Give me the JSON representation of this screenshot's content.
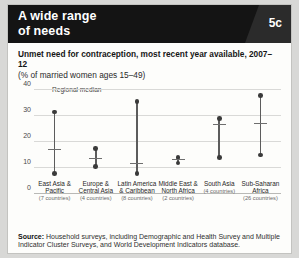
{
  "header": {
    "title_line1": "A wide range",
    "title_line2": "of needs",
    "badge": "5c"
  },
  "chart_title": "Unmet need for contraception, most recent year available, 2007–12",
  "chart_subtitle": "(% of married women ages 15–49)",
  "source": {
    "label": "Source:",
    "text": " Household surveys, including Demographic and Health Survey and Multiple Indicator Cluster Surveys, and World Development Indicators database."
  },
  "chart_data": {
    "type": "scatter",
    "title": "Unmet need for contraception, most recent year available, 2007–12",
    "subtitle": "(% of married women ages 15–49)",
    "xlabel": "",
    "ylabel": "",
    "ylim": [
      0,
      40
    ],
    "yticks": [
      0,
      10,
      20,
      30,
      40
    ],
    "grid": true,
    "legend": [
      {
        "name": "Regional median",
        "marker": "horizontal-line",
        "color": "#6e6e6e"
      }
    ],
    "legend_position": "top-left",
    "marker_color": "#3a3a3a",
    "line_color": "#5c5c5c",
    "categories": [
      "East Asia & Pacific",
      "Europe & Central Asia",
      "Latin America & Caribbean",
      "Middle East & North Africa",
      "South Asia",
      "Sub-Saharan Africa"
    ],
    "category_sublabels": [
      "(7 countries)",
      "(4 countries)",
      "(8 countries)",
      "(2 countries)",
      "(4 countries)",
      "(26 countries)"
    ],
    "series": [
      {
        "name": "Maximum",
        "values": [
          31.5,
          17.5,
          35.5,
          14.0,
          29.0,
          38.0
        ]
      },
      {
        "name": "Minimum",
        "values": [
          8.0,
          10.5,
          8.0,
          12.0,
          14.0,
          15.0
        ]
      },
      {
        "name": "Regional median",
        "values": [
          17.0,
          13.5,
          11.5,
          13.0,
          26.5,
          27.0
        ]
      }
    ],
    "points": [
      {
        "category": "East Asia & Pacific",
        "sublabel": "(7 countries)",
        "min": 8.0,
        "median": 17.0,
        "max": 31.5
      },
      {
        "category": "Europe & Central Asia",
        "sublabel": "(4 countries)",
        "min": 10.5,
        "median": 13.5,
        "max": 17.5
      },
      {
        "category": "Latin America & Caribbean",
        "sublabel": "(8 countries)",
        "min": 8.0,
        "median": 11.5,
        "max": 35.5
      },
      {
        "category": "Middle East & North Africa",
        "sublabel": "(2 countries)",
        "min": 12.0,
        "median": 13.0,
        "max": 14.0
      },
      {
        "category": "South Asia",
        "sublabel": "(4 countries)",
        "min": 14.0,
        "median": 26.5,
        "max": 29.0
      },
      {
        "category": "Sub-Saharan Africa",
        "sublabel": "(26 countries)",
        "min": 15.0,
        "median": 27.0,
        "max": 38.0
      }
    ]
  }
}
